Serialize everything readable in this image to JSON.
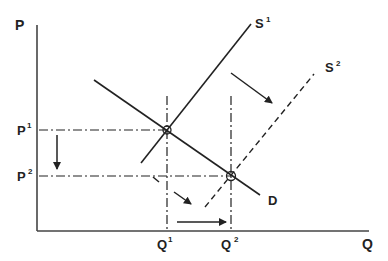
{
  "diagram": {
    "axes": {
      "y_label": "P",
      "x_label": "Q"
    },
    "price_labels": [
      {
        "base": "P",
        "sup": "1"
      },
      {
        "base": "P",
        "sup": "2"
      }
    ],
    "quantity_labels": [
      {
        "base": "Q",
        "sup": "1"
      },
      {
        "base": "Q",
        "sup": "2"
      }
    ],
    "curves": {
      "supply_1": {
        "base": "S",
        "sup": "1",
        "style": "solid"
      },
      "supply_2": {
        "base": "S",
        "sup": "2",
        "style": "dashed"
      },
      "demand": {
        "label": "D",
        "style": "solid"
      }
    },
    "equilibria": [
      {
        "name": "E1",
        "price": "P1",
        "quantity": "Q1"
      },
      {
        "name": "E2",
        "price": "P2",
        "quantity": "Q2"
      }
    ],
    "arrows": [
      {
        "name": "supply-shift-arrow-upper",
        "meaning": "supply curve shifts right"
      },
      {
        "name": "supply-shift-arrow-lower",
        "meaning": "supply curve shifts right"
      },
      {
        "name": "price-decrease-arrow",
        "meaning": "price falls from P1 to P2"
      },
      {
        "name": "quantity-increase-arrow",
        "meaning": "quantity rises from Q1 to Q2"
      }
    ],
    "colors": {
      "line": "#222222",
      "background": "#ffffff"
    }
  }
}
